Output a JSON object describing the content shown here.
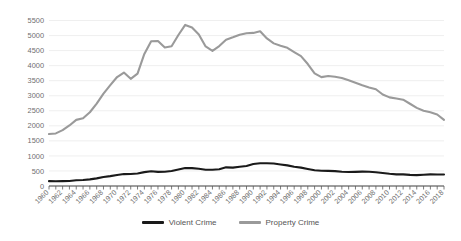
{
  "chart_data": {
    "type": "line",
    "title": "",
    "xlabel": "",
    "ylabel": "",
    "ylim": [
      0,
      5500
    ],
    "ytick_step": 500,
    "grid": true,
    "legend_position": "bottom",
    "x": [
      1960,
      1961,
      1962,
      1963,
      1964,
      1965,
      1966,
      1967,
      1968,
      1969,
      1970,
      1971,
      1972,
      1973,
      1974,
      1975,
      1976,
      1977,
      1978,
      1979,
      1980,
      1981,
      1982,
      1983,
      1984,
      1985,
      1986,
      1987,
      1988,
      1989,
      1990,
      1991,
      1992,
      1993,
      1994,
      1995,
      1996,
      1997,
      1998,
      1999,
      2000,
      2001,
      2002,
      2003,
      2004,
      2005,
      2006,
      2007,
      2008,
      2009,
      2010,
      2011,
      2012,
      2013,
      2014,
      2015,
      2016,
      2017,
      2018
    ],
    "xtick_labels": [
      "1960",
      "1962",
      "1964",
      "1966",
      "1968",
      "1970",
      "1972",
      "1974",
      "1976",
      "1978",
      "1980",
      "1982",
      "1984",
      "1986",
      "1988",
      "1990",
      "1992",
      "1994",
      "1996",
      "1998",
      "2000",
      "2002",
      "2004",
      "2006",
      "2008",
      "2010",
      "2012",
      "2014",
      "2016",
      "2018"
    ],
    "ytick_labels": [
      "0",
      "500",
      "1000",
      "1500",
      "2000",
      "2500",
      "3000",
      "3500",
      "4000",
      "4500",
      "5000",
      "5500"
    ],
    "series": [
      {
        "name": "Violent Crime",
        "color": "#1a1a1a",
        "values": [
          161,
          158,
          162,
          168,
          191,
          200,
          220,
          253,
          298,
          328,
          364,
          396,
          401,
          417,
          461,
          488,
          468,
          476,
          498,
          549,
          597,
          594,
          571,
          538,
          539,
          557,
          620,
          610,
          637,
          666,
          730,
          758,
          758,
          747,
          714,
          685,
          637,
          611,
          568,
          523,
          507,
          504,
          494,
          476,
          464,
          469,
          479,
          472,
          458,
          432,
          405,
          387,
          387,
          370,
          362,
          373,
          386,
          383,
          381
        ]
      },
      {
        "name": "Property Crime",
        "color": "#9a9a9a",
        "values": [
          1726,
          1747,
          1857,
          2012,
          2198,
          2249,
          2451,
          2736,
          3071,
          3351,
          3621,
          3769,
          3561,
          3737,
          4389,
          4811,
          4820,
          4602,
          4643,
          5017,
          5353,
          5264,
          5033,
          4637,
          4492,
          4651,
          4863,
          4940,
          5027,
          5078,
          5088,
          5140,
          4903,
          4740,
          4660,
          4591,
          4451,
          4316,
          4053,
          3744,
          3618,
          3658,
          3631,
          3591,
          3514,
          3432,
          3347,
          3277,
          3215,
          3041,
          2946,
          2905,
          2868,
          2734,
          2596,
          2500,
          2451,
          2376,
          2200
        ]
      }
    ]
  },
  "legend": {
    "items": [
      {
        "label": "Violent Crime",
        "color": "#1a1a1a"
      },
      {
        "label": "Property Crime",
        "color": "#9a9a9a"
      }
    ]
  }
}
